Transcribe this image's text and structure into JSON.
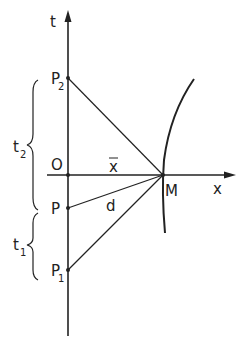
{
  "diagram": {
    "colors": {
      "background": "#ffffff",
      "stroke": "#222222"
    },
    "axes": {
      "vertical": {
        "label": "t"
      },
      "horizontal": {
        "label": "x"
      }
    },
    "points": {
      "P2": {
        "letter": "P",
        "subscript": "2"
      },
      "O": {
        "letter": "O"
      },
      "P": {
        "letter": "P"
      },
      "P1": {
        "letter": "P",
        "subscript": "1"
      },
      "M": {
        "letter": "M"
      }
    },
    "segments": {
      "xbar": {
        "label": "x"
      },
      "d": {
        "label": "d"
      }
    },
    "intervals": {
      "t2": {
        "letter": "t",
        "subscript": "2"
      },
      "t1": {
        "letter": "t",
        "subscript": "1"
      }
    }
  }
}
